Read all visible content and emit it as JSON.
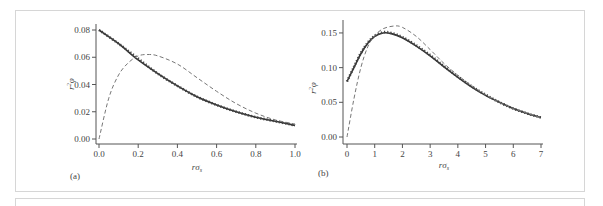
{
  "chart_data": [
    {
      "panel": "(a)",
      "type": "line",
      "xlabel": "rσs",
      "ylabel": "r²φ",
      "xlim": [
        0.0,
        1.0
      ],
      "ylim": [
        0.0,
        0.08
      ],
      "xticks": [
        "0.0",
        "0.2",
        "0.4",
        "0.6",
        "0.8",
        "1.0"
      ],
      "yticks": [
        "0.00",
        "0.02",
        "0.04",
        "0.06",
        "0.08"
      ],
      "grid": false,
      "series": [
        {
          "name": "solid",
          "style": "solid",
          "x": [
            0.0,
            0.1,
            0.2,
            0.3,
            0.4,
            0.5,
            0.6,
            0.7,
            0.8,
            0.9,
            1.0
          ],
          "y": [
            0.08,
            0.07,
            0.058,
            0.048,
            0.039,
            0.031,
            0.025,
            0.02,
            0.016,
            0.013,
            0.01
          ]
        },
        {
          "name": "dotted",
          "style": "dotted",
          "x": [
            0.0,
            0.1,
            0.2,
            0.3,
            0.4,
            0.5,
            0.6,
            0.7,
            0.8,
            0.9,
            1.0
          ],
          "y": [
            0.08,
            0.07,
            0.059,
            0.048,
            0.039,
            0.031,
            0.025,
            0.02,
            0.016,
            0.013,
            0.01
          ]
        },
        {
          "name": "dashed",
          "style": "dashed",
          "x": [
            0.0,
            0.05,
            0.1,
            0.15,
            0.2,
            0.25,
            0.3,
            0.4,
            0.5,
            0.6,
            0.7,
            0.8,
            0.9,
            1.0
          ],
          "y": [
            0.0,
            0.03,
            0.047,
            0.056,
            0.061,
            0.062,
            0.061,
            0.055,
            0.045,
            0.035,
            0.026,
            0.019,
            0.014,
            0.011
          ]
        }
      ]
    },
    {
      "panel": "(b)",
      "type": "line",
      "xlabel": "rσs",
      "ylabel": "r²φ",
      "xlim": [
        0,
        7
      ],
      "ylim": [
        0.0,
        0.16
      ],
      "xticks": [
        "0",
        "1",
        "2",
        "3",
        "4",
        "5",
        "6",
        "7"
      ],
      "yticks": [
        "0.00",
        "0.05",
        "0.10",
        "0.15"
      ],
      "grid": false,
      "series": [
        {
          "name": "solid",
          "style": "solid",
          "x": [
            0.0,
            0.25,
            0.5,
            0.75,
            1.0,
            1.3,
            1.6,
            2.0,
            2.5,
            3.0,
            3.5,
            4.0,
            4.5,
            5.0,
            5.5,
            6.0,
            6.5,
            7.0
          ],
          "y": [
            0.08,
            0.1,
            0.12,
            0.135,
            0.145,
            0.15,
            0.149,
            0.143,
            0.131,
            0.117,
            0.101,
            0.086,
            0.072,
            0.06,
            0.05,
            0.041,
            0.034,
            0.028
          ]
        },
        {
          "name": "dotted",
          "style": "dotted",
          "x": [
            0.0,
            0.25,
            0.5,
            0.75,
            1.0,
            1.3,
            1.6,
            2.0,
            2.5,
            3.0,
            3.5,
            4.0,
            4.5,
            5.0,
            5.5,
            6.0,
            6.5,
            7.0
          ],
          "y": [
            0.08,
            0.101,
            0.121,
            0.136,
            0.146,
            0.151,
            0.15,
            0.144,
            0.132,
            0.118,
            0.102,
            0.087,
            0.073,
            0.061,
            0.05,
            0.041,
            0.034,
            0.028
          ]
        },
        {
          "name": "dashed",
          "style": "dashed",
          "x": [
            0.0,
            0.25,
            0.5,
            0.75,
            1.0,
            1.3,
            1.7,
            2.0,
            2.5,
            3.0,
            3.5,
            4.0,
            4.5,
            5.0,
            5.5,
            6.0,
            6.5,
            7.0
          ],
          "y": [
            0.0,
            0.055,
            0.1,
            0.13,
            0.146,
            0.156,
            0.16,
            0.158,
            0.145,
            0.126,
            0.106,
            0.089,
            0.074,
            0.061,
            0.05,
            0.041,
            0.034,
            0.028
          ]
        }
      ]
    }
  ],
  "labels": {
    "a": {
      "panel": "(a)",
      "xlabel_main": "rσ",
      "xlabel_sub": "s",
      "ylabel_main": "r",
      "ylabel_sup": "2",
      "ylabel_phi": "φ"
    },
    "b": {
      "panel": "(b)",
      "xlabel_main": "rσ",
      "xlabel_sub": "s",
      "ylabel_main": "r",
      "ylabel_sup": "2",
      "ylabel_phi": "φ"
    }
  }
}
